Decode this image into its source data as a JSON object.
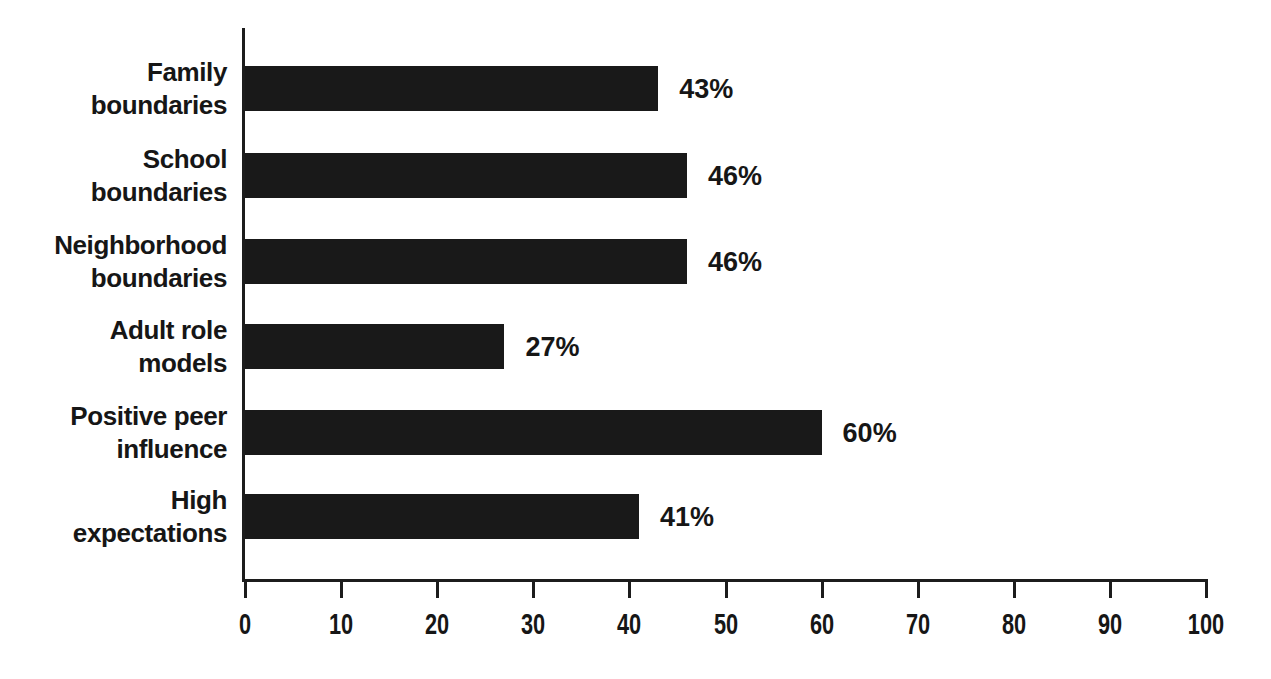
{
  "chart_data": {
    "type": "bar",
    "orientation": "horizontal",
    "title": "",
    "xlabel": "",
    "ylabel": "",
    "categories": [
      "Family boundaries",
      "School boundaries",
      "Neighborhood boundaries",
      "Adult role models",
      "Positive peer influence",
      "High expectations"
    ],
    "category_lines": [
      [
        "Family",
        "boundaries"
      ],
      [
        "School",
        "boundaries"
      ],
      [
        "Neighborhood",
        "boundaries"
      ],
      [
        "Adult role",
        "models"
      ],
      [
        "Positive peer",
        "influence"
      ],
      [
        "High",
        "expectations"
      ]
    ],
    "values": [
      43,
      46,
      46,
      27,
      60,
      41
    ],
    "value_labels": [
      "43%",
      "46%",
      "46%",
      "27%",
      "60%",
      "41%"
    ],
    "xlim": [
      0,
      100
    ],
    "x_ticks": [
      0,
      10,
      20,
      30,
      40,
      50,
      60,
      70,
      80,
      90,
      100
    ],
    "x_tick_labels": [
      "0",
      "10",
      "20",
      "30",
      "40",
      "50",
      "60",
      "70",
      "80",
      "90",
      "100"
    ],
    "grid": false,
    "legend": false,
    "colors": {
      "bar": "#191919",
      "axis": "#1c1c1c",
      "text": "#161616",
      "background": "#ffffff"
    }
  }
}
